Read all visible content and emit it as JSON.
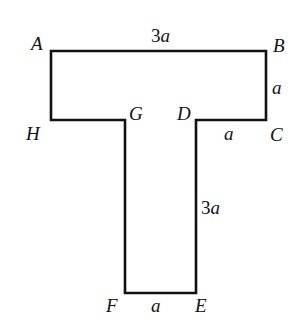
{
  "figure": {
    "shape": "T-shaped polygon",
    "vertices": [
      {
        "name": "A",
        "x": 51,
        "y": 51
      },
      {
        "name": "B",
        "x": 266,
        "y": 51
      },
      {
        "name": "C",
        "x": 266,
        "y": 120
      },
      {
        "name": "D",
        "x": 196,
        "y": 120
      },
      {
        "name": "E",
        "x": 196,
        "y": 293
      },
      {
        "name": "F",
        "x": 125,
        "y": 293
      },
      {
        "name": "G",
        "x": 125,
        "y": 120
      },
      {
        "name": "H",
        "x": 51,
        "y": 120
      }
    ],
    "labels": {
      "A": "A",
      "B": "B",
      "C": "C",
      "D": "D",
      "E": "E",
      "F": "F",
      "G": "G",
      "H": "H"
    },
    "dimensions": {
      "AB": "3a",
      "BC": "a",
      "DC": "a",
      "DE": "3a",
      "FE": "a"
    },
    "stroke_color": "#111111"
  }
}
